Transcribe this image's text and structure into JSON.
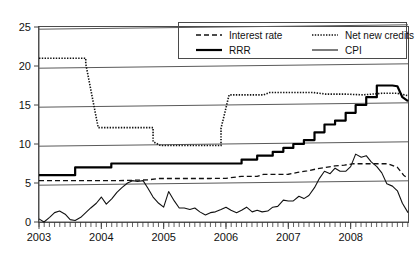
{
  "chart_data": {
    "type": "line",
    "title": "",
    "subtitle": "",
    "xlabel": "",
    "ylabel": "",
    "xlim": [
      2003.0,
      2008.92
    ],
    "ylim": [
      0,
      25
    ],
    "yticks": [
      0,
      5,
      10,
      15,
      20,
      25
    ],
    "ytick_labels": [
      "0",
      "5",
      "10",
      "15",
      "20",
      "25"
    ],
    "xticks": [
      2003,
      2004,
      2005,
      2006,
      2007,
      2008
    ],
    "xtick_labels": [
      "2003",
      "2004",
      "2005",
      "2006",
      "2007",
      "2008"
    ],
    "minor_xtick_interval_months": 1,
    "grid": "horizontal",
    "legend": {
      "position": "top-right-inside",
      "entries": [
        {
          "label": "Interest rate",
          "style": "dashed",
          "width": "thin"
        },
        {
          "label": "Net new credits",
          "style": "dotted",
          "width": "thin"
        },
        {
          "label": "RRR",
          "style": "solid",
          "width": "thick"
        },
        {
          "label": "CPI",
          "style": "solid",
          "width": "thin"
        }
      ]
    },
    "series": [
      {
        "name": "Interest rate",
        "style": "dashed",
        "x": [
          2003.0,
          2003.25,
          2003.5,
          2003.75,
          2004.0,
          2004.25,
          2004.5,
          2004.75,
          2004.92,
          2005.1,
          2005.4,
          2005.75,
          2006.0,
          2006.25,
          2006.5,
          2006.6,
          2006.75,
          2007.0,
          2007.15,
          2007.3,
          2007.45,
          2007.6,
          2007.75,
          2007.9,
          2008.05,
          2008.2,
          2008.4,
          2008.6,
          2008.75,
          2008.85,
          2008.92
        ],
        "values": [
          5.3,
          5.3,
          5.3,
          5.3,
          5.3,
          5.3,
          5.35,
          5.4,
          5.58,
          5.58,
          5.58,
          5.58,
          5.6,
          5.85,
          5.85,
          6.1,
          6.1,
          6.12,
          6.35,
          6.55,
          6.8,
          7.0,
          7.2,
          7.3,
          7.47,
          7.47,
          7.47,
          7.47,
          7.0,
          6.0,
          5.6
        ]
      },
      {
        "name": "Net new credits",
        "style": "dotted",
        "x": [
          2003.0,
          2003.75,
          2003.75,
          2003.95,
          2003.95,
          2004.83,
          2004.83,
          2004.95,
          2004.95,
          2005.92,
          2005.92,
          2006.05,
          2006.05,
          2006.6,
          2006.7,
          2007.0,
          2007.4,
          2007.6,
          2007.9,
          2008.2,
          2008.5,
          2008.75,
          2008.92
        ],
        "values": [
          21.0,
          21.0,
          20.3,
          12.1,
          12.1,
          12.1,
          10.3,
          9.8,
          9.8,
          9.8,
          12.0,
          16.3,
          16.3,
          16.3,
          16.6,
          16.6,
          16.6,
          16.4,
          16.4,
          16.3,
          16.5,
          16.5,
          16.2
        ]
      },
      {
        "name": "RRR",
        "style": "solid-thick",
        "x": [
          2003.0,
          2003.58,
          2003.58,
          2004.16,
          2004.16,
          2006.25,
          2006.25,
          2006.5,
          2006.5,
          2006.75,
          2006.75,
          2006.92,
          2006.92,
          2007.08,
          2007.08,
          2007.25,
          2007.25,
          2007.42,
          2007.42,
          2007.58,
          2007.58,
          2007.75,
          2007.75,
          2007.92,
          2007.92,
          2008.08,
          2008.08,
          2008.25,
          2008.25,
          2008.42,
          2008.42,
          2008.67,
          2008.75,
          2008.83,
          2008.92
        ],
        "values": [
          6.0,
          6.0,
          7.0,
          7.0,
          7.5,
          7.5,
          8.0,
          8.0,
          8.5,
          8.5,
          9.0,
          9.0,
          9.5,
          9.5,
          10.0,
          10.0,
          10.5,
          10.5,
          11.5,
          11.5,
          12.5,
          12.5,
          13.0,
          13.0,
          14.0,
          14.0,
          15.0,
          15.0,
          16.0,
          16.0,
          17.5,
          17.5,
          17.4,
          16.0,
          15.5
        ]
      },
      {
        "name": "CPI",
        "style": "solid-thin",
        "x": [
          2003.0,
          2003.08,
          2003.17,
          2003.25,
          2003.33,
          2003.42,
          2003.5,
          2003.58,
          2003.67,
          2003.75,
          2003.83,
          2003.92,
          2004.0,
          2004.08,
          2004.17,
          2004.25,
          2004.33,
          2004.42,
          2004.5,
          2004.58,
          2004.67,
          2004.75,
          2004.83,
          2004.92,
          2005.0,
          2005.08,
          2005.17,
          2005.25,
          2005.33,
          2005.42,
          2005.5,
          2005.58,
          2005.67,
          2005.75,
          2005.83,
          2005.92,
          2006.0,
          2006.08,
          2006.17,
          2006.25,
          2006.33,
          2006.42,
          2006.5,
          2006.58,
          2006.67,
          2006.75,
          2006.83,
          2006.92,
          2007.0,
          2007.08,
          2007.17,
          2007.25,
          2007.33,
          2007.42,
          2007.5,
          2007.58,
          2007.67,
          2007.75,
          2007.83,
          2007.92,
          2008.0,
          2008.08,
          2008.17,
          2008.25,
          2008.33,
          2008.42,
          2008.5,
          2008.58,
          2008.67,
          2008.75,
          2008.83,
          2008.92
        ],
        "values": [
          0.4,
          0.0,
          0.6,
          1.2,
          1.4,
          1.0,
          0.3,
          0.2,
          0.6,
          1.2,
          1.8,
          2.4,
          3.2,
          2.3,
          3.0,
          3.8,
          4.4,
          5.0,
          5.3,
          5.2,
          5.3,
          4.3,
          3.2,
          2.4,
          1.9,
          3.9,
          2.7,
          1.8,
          1.8,
          1.6,
          1.8,
          1.3,
          0.9,
          1.2,
          1.3,
          1.6,
          1.9,
          1.5,
          1.2,
          1.5,
          1.9,
          1.3,
          1.5,
          1.3,
          1.4,
          1.9,
          2.0,
          2.8,
          2.7,
          2.7,
          3.3,
          3.0,
          3.4,
          4.4,
          5.6,
          6.5,
          6.2,
          6.9,
          6.5,
          6.5,
          7.1,
          8.7,
          8.3,
          8.5,
          7.7,
          7.1,
          6.3,
          4.9,
          4.6,
          4.0,
          2.4,
          1.2
        ]
      }
    ]
  },
  "colors": {
    "ink": "#111111",
    "grid": "#5a5a5a",
    "background": "#ffffff"
  }
}
